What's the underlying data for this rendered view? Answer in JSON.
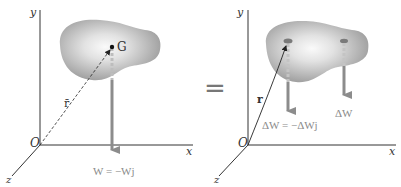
{
  "figure": {
    "left": {
      "axes": {
        "y": "y",
        "x": "x",
        "z": "z",
        "origin": "O"
      },
      "centroid_label": "G",
      "position_vector_label": "r̄",
      "weight_label": "W = −Wj"
    },
    "equals_sign": "=",
    "right": {
      "axes": {
        "y": "y",
        "x": "x",
        "z": "z",
        "origin": "O"
      },
      "position_vector_label": "r",
      "element_weight_label": "ΔW = −ΔWj",
      "second_element_label": "ΔW"
    },
    "colors": {
      "axis": "#333333",
      "arrow": "#8c8c8c",
      "blob_outer": "#9a9a9a",
      "blob_inner": "#f4f4f4",
      "element_marker": "#7a7a7a"
    }
  }
}
